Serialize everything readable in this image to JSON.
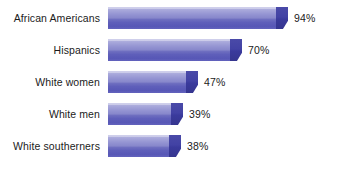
{
  "chart_data": {
    "type": "bar",
    "orientation": "horizontal",
    "title": "",
    "subtitle": "",
    "xlabel": "",
    "ylabel": "",
    "grid": false,
    "legend": null,
    "axis_visible": false,
    "xlim": [
      0,
      100
    ],
    "unit": "%",
    "categories": [
      "African Americans",
      "Hispanics",
      "White women",
      "White men",
      "White southerners"
    ],
    "values": [
      94,
      70,
      47,
      39,
      38
    ],
    "value_labels": [
      "94%",
      "70%",
      "47%",
      "39%",
      "38%"
    ],
    "colors": {
      "bar_light": "#b9b9e2",
      "bar_mid": "#8787cb",
      "bar_dark": "#5757b6",
      "bar_cap": "#3a3a9c",
      "background": "#ffffff",
      "text": "#1b1b1b"
    }
  }
}
